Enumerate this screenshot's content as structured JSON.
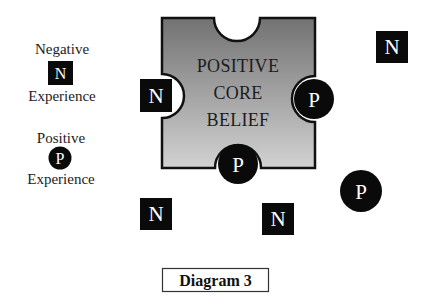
{
  "legend": {
    "negative": {
      "top_label": "Negative",
      "symbol": "N",
      "bottom_label": "Experience",
      "shape": "square"
    },
    "positive": {
      "top_label": "Positive",
      "symbol": "P",
      "bottom_label": "Experience",
      "shape": "circle"
    }
  },
  "core": {
    "line1": "POSITIVE",
    "line2": "CORE",
    "line3": "BELIEF",
    "gradient_top": "#767676",
    "gradient_bottom": "#cfcfcf",
    "outline": "#111111"
  },
  "tokens": {
    "n_left_notch": "N",
    "p_right_notch": "P",
    "p_bottom_notch": "P",
    "n_top_right": "N",
    "n_bottom_left": "N",
    "n_bottom_middle": "N",
    "p_bottom_right": "P"
  },
  "caption": "Diagram 3",
  "colors": {
    "token_fill": "#0a0a0a",
    "token_text": "#ffffff",
    "background": "#ffffff"
  }
}
